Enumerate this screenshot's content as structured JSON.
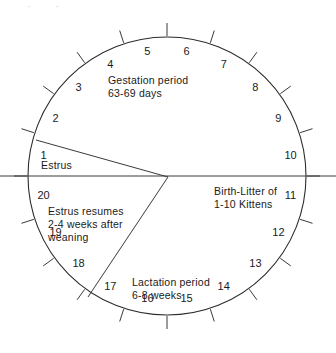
{
  "diagram": {
    "geometry": {
      "center_x": 167,
      "center_y": 176,
      "radius": 139,
      "tick_inner_offset": 1,
      "tick_length": 13,
      "number_radius": 125,
      "segment_count": 20
    },
    "colors": {
      "line": "#3a3a3a",
      "circle": "#2b2b2b",
      "text": "#1a1a1a",
      "background": "#ffffff"
    },
    "numbers": [
      "1",
      "2",
      "3",
      "4",
      "5",
      "6",
      "7",
      "8",
      "9",
      "10",
      "11",
      "12",
      "13",
      "14",
      "15",
      "16",
      "17",
      "18",
      "19",
      "20"
    ],
    "phases": [
      {
        "id": "gestation",
        "lines": [
          "Gestation period",
          "63-69 days"
        ]
      },
      {
        "id": "estrus",
        "lines": [
          "Estrus"
        ]
      },
      {
        "id": "birth",
        "lines": [
          "Birth-Litter of",
          "1-10 Kittens"
        ]
      },
      {
        "id": "estrus_resumes",
        "lines": [
          "Estrus resumes",
          "2-4 weeks after",
          "weaning"
        ]
      },
      {
        "id": "lactation",
        "lines": [
          "Lactation period",
          "6-8 weeks"
        ]
      }
    ],
    "sector_divider_lines": [
      {
        "id": "estrus-upper-divider",
        "from": "center",
        "to_x": 36,
        "to_y": 140
      },
      {
        "id": "estrus-lower-divider",
        "from": "center",
        "to_x": 88,
        "to_y": 297
      }
    ],
    "horizontal_axis": {
      "id": "horizontal-diameter",
      "x1": 0,
      "y1": 176,
      "x2": 336,
      "y2": 176
    },
    "top_artifact": "  —  ·        ·"
  }
}
